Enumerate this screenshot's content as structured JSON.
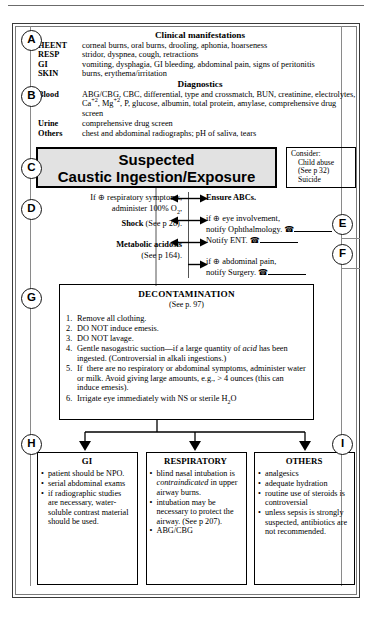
{
  "sections": {
    "A": {
      "marker": "A",
      "heading": "Clinical manifestations",
      "rows": [
        {
          "label": "HEENT",
          "value": "corneal burns, oral burns, drooling, aphonia, hoarseness"
        },
        {
          "label": "RESP",
          "value": "stridor, dyspnea, cough, retractions"
        },
        {
          "label": "GI",
          "value": "vomiting, dysphagia, GI bleeding, abdominal pain, signs of peritonitis"
        },
        {
          "label": "SKIN",
          "value": "burns, erythema/irritation"
        }
      ]
    },
    "B": {
      "marker": "B",
      "heading": "Diagnostics",
      "rows": [
        {
          "label": "Blood",
          "value": "ABG/CBG, CBC, differential, type and crossmatch, BUN, creatinine, electrolytes, Ca+2, Mg+2, P, glucose, albumin, total protein, amylase, comprehensive drug screen"
        },
        {
          "label": "Urine",
          "value": "comprehensive drug screen"
        },
        {
          "label": "Others",
          "value": "chest and abdominal radiographs; pH of saliva, tears"
        }
      ]
    },
    "C": {
      "marker": "C",
      "title_line1": "Suspected",
      "title_line2": "Caustic Ingestion/Exposure",
      "consider": {
        "label": "Consider:",
        "item1": "Child abuse",
        "item1_ref": "(See p 32)",
        "item2": "Suicide"
      }
    },
    "D": {
      "marker": "D",
      "items": [
        {
          "text": "If ⊕ respiratory symptoms,",
          "bold": false
        },
        {
          "text": "administer 100% O2,",
          "bold": false
        },
        {
          "text": "Shock",
          "suffix": " (See p 28).",
          "bold": true
        },
        {
          "text": "Metabolic acidosis",
          "bold": true
        },
        {
          "text": "(See p 164).",
          "bold": false
        }
      ]
    },
    "E": {
      "marker": "E",
      "items": [
        {
          "text": "Ensure ABCs.",
          "bold": true
        },
        {
          "text": "if ⊕ eye involvement,",
          "bold": false
        },
        {
          "text": "notify Ophthalmology.",
          "bold": false,
          "phone": true
        }
      ]
    },
    "F": {
      "marker": "F",
      "items": [
        {
          "text": "Notify ENT.",
          "bold": false,
          "phone": true
        },
        {
          "text": "if ⊕ abdominal pain,",
          "bold": false
        },
        {
          "text": "notify Surgery.",
          "bold": false,
          "phone": true
        }
      ]
    },
    "G": {
      "marker": "G",
      "title": "DECONTAMINATION",
      "ref": "(See p. 97)",
      "steps": [
        {
          "n": "1.",
          "text": "Remove all clothing."
        },
        {
          "n": "2.",
          "text": "DO NOT induce emesis."
        },
        {
          "n": "3.",
          "text": "DO NOT lavage."
        },
        {
          "n": "4.",
          "text": "Gentle nasogastric suction—if a large quantity of acid has been ingested. (Controversial in alkali ingestions.)"
        },
        {
          "n": "5.",
          "text": "If there are no respiratory or abdominal symptoms, administer water or milk. Avoid giving large amounts, e.g., > 4 ounces (this can induce emesis)."
        },
        {
          "n": "6.",
          "text": "Irrigate eye immediately with NS or sterile H2O"
        }
      ]
    },
    "H": {
      "marker": "H"
    },
    "I": {
      "marker": "I"
    },
    "columns": [
      {
        "title": "GI",
        "items": [
          "patient should be NPO.",
          "serial abdominal exams",
          "if radiographic studies are necessary, water-soluble contrast material should be used."
        ]
      },
      {
        "title": "RESPIRATORY",
        "items": [
          "blind nasal intubation is contraindicated in upper airway burns.",
          "intubation may be necessary to protect the airway. (See p 207).",
          "ABG/CBG"
        ]
      },
      {
        "title": "OTHERS",
        "items": [
          "analgesics",
          "adequate hydration",
          "routine use of steroids is controversial",
          "unless sepsis is strongly suspected, antibiotics are not recommended."
        ]
      }
    ]
  },
  "icons": {
    "phone": "☎",
    "bullet": "•"
  },
  "colors": {
    "title_box_fill": "#e2e2e2",
    "border": "#000000",
    "rail": "#8a8a8a"
  }
}
